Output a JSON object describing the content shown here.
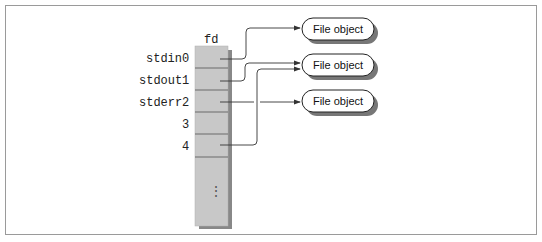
{
  "diagram": {
    "table_header": "fd",
    "rows": [
      {
        "label": "stdin",
        "index": "0"
      },
      {
        "label": "stdout",
        "index": "1"
      },
      {
        "label": "stderr",
        "index": "2"
      },
      {
        "label": "",
        "index": "3"
      },
      {
        "label": "",
        "index": "4"
      }
    ],
    "ellipsis": "⋮",
    "file_objects": [
      {
        "label": "File object"
      },
      {
        "label": "File object"
      },
      {
        "label": "File object"
      }
    ],
    "connections": [
      {
        "from": "0",
        "to": 0
      },
      {
        "from": "1",
        "to": 1
      },
      {
        "from": "4",
        "to": 1
      },
      {
        "from": "2",
        "to": 2
      }
    ],
    "colors": {
      "table_fill": "#c8c8c8",
      "table_line": "#6a6a6a",
      "box_fill": "#ffffff",
      "box_shadow": "#8a8a8a",
      "arrow": "#333333"
    }
  }
}
